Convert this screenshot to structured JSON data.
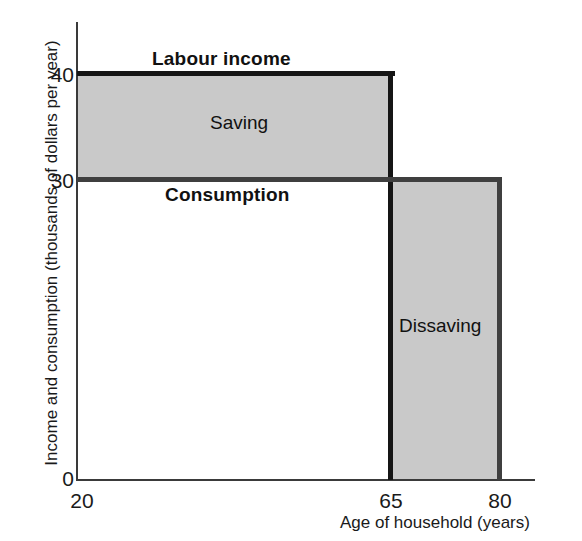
{
  "chart_data": {
    "type": "line",
    "title": "",
    "subtitle": "",
    "xlabel": "Age of household (years)",
    "ylabel": "Income and consumption (thousands of dollars per year)",
    "xlim": [
      20,
      85
    ],
    "ylim": [
      0,
      45
    ],
    "xticks": [
      "20",
      "65",
      "80"
    ],
    "xtick_values": [
      20,
      65,
      80
    ],
    "yticks": [
      "0",
      "30",
      "40"
    ],
    "ytick_values": [
      0,
      30,
      40
    ],
    "grid": false,
    "legend": "none",
    "series": [
      {
        "name": "Labour income",
        "x": [
          20,
          65,
          65,
          80
        ],
        "values": [
          40,
          40,
          0,
          0
        ],
        "color": "#151515",
        "style": "step-thick"
      },
      {
        "name": "Consumption",
        "x": [
          20,
          65,
          80,
          80
        ],
        "values": [
          30,
          30,
          30,
          0
        ],
        "color": "#3f3f3f",
        "style": "step-thick"
      }
    ],
    "shaded_regions": [
      {
        "name": "Saving",
        "label": "Saving",
        "x_range": [
          20,
          65
        ],
        "y_range": [
          30,
          40
        ],
        "fill": "#c9c9c9",
        "meaning": "Labour income exceeds consumption between ages 20 and 65"
      },
      {
        "name": "Dissaving",
        "label": "Dissaving",
        "x_range": [
          65,
          80
        ],
        "y_range": [
          0,
          30
        ],
        "fill": "#c9c9c9",
        "meaning": "Consumption exceeds zero labour income between ages 65 and 80"
      }
    ],
    "annotations": [
      {
        "text": "Labour income",
        "bold": true,
        "x": 33,
        "y": 42
      },
      {
        "text": "Consumption",
        "bold": true,
        "x": 35,
        "y": 28
      },
      {
        "text": "Saving",
        "bold": false,
        "x": 43,
        "y": 35
      },
      {
        "text": "Dissaving",
        "bold": false,
        "x": 72,
        "y": 15
      }
    ]
  },
  "axes": {
    "y_title": "Income and consumption (thousands of dollars per year)",
    "x_title": "Age of household (years)",
    "y_ticks": [
      {
        "label": "40",
        "value": 40
      },
      {
        "label": "30",
        "value": 30
      },
      {
        "label": "0",
        "value": 0
      }
    ],
    "x_ticks": [
      {
        "label": "20",
        "value": 20
      },
      {
        "label": "65",
        "value": 65
      },
      {
        "label": "80",
        "value": 80
      }
    ]
  },
  "labels": {
    "labour_income": "Labour income",
    "consumption": "Consumption",
    "saving": "Saving",
    "dissaving": "Dissaving"
  },
  "colors": {
    "background": "#ffffff",
    "axis": "#3a3a3a",
    "shade_fill": "#c9c9c9",
    "labour_income_line": "#151515",
    "consumption_line": "#3f3f3f",
    "text": "#1a1a1a"
  }
}
